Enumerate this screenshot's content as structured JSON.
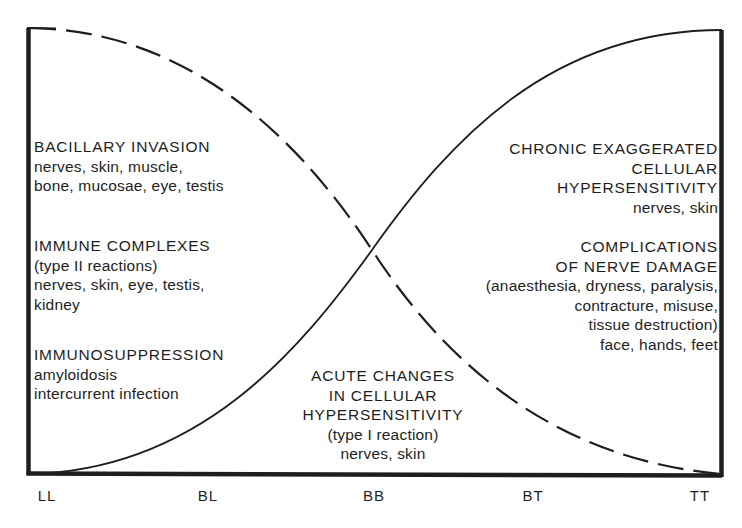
{
  "diagram": {
    "type": "leprosy-spectrum-complications",
    "x_axis": {
      "ticks": [
        "LL",
        "BL",
        "BB",
        "BT",
        "TT"
      ]
    },
    "curves": [
      {
        "name": "bacillary-load",
        "style": "dashed",
        "from": "LL high",
        "to": "TT low"
      },
      {
        "name": "cellular-immunity",
        "style": "solid",
        "from": "LL low",
        "to": "TT high"
      }
    ],
    "left_blocks": [
      {
        "heading": "BACILLARY INVASION",
        "lines": [
          "nerves, skin, muscle,",
          "bone, mucosae, eye, testis"
        ]
      },
      {
        "heading": "IMMUNE COMPLEXES",
        "lines": [
          "(type II reactions)",
          "nerves, skin, eye, testis,",
          "kidney"
        ]
      },
      {
        "heading": "IMMUNOSUPPRESSION",
        "lines": [
          "amyloidosis",
          "intercurrent infection"
        ]
      }
    ],
    "center_block": {
      "heading_lines": [
        "ACUTE CHANGES",
        "IN CELLULAR",
        "HYPERSENSITIVITY"
      ],
      "lines": [
        "(type I reaction)",
        "nerves, skin"
      ]
    },
    "right_blocks": [
      {
        "heading_lines": [
          "CHRONIC EXAGGERATED",
          "CELLULAR",
          "HYPERSENSITIVITY"
        ],
        "lines": [
          "nerves, skin"
        ]
      },
      {
        "heading_lines": [
          "COMPLICATIONS",
          "OF NERVE DAMAGE"
        ],
        "lines": [
          "(anaesthesia, dryness, paralysis,",
          "contracture, misuse,",
          "tissue destruction)",
          "face, hands, feet"
        ]
      }
    ]
  }
}
